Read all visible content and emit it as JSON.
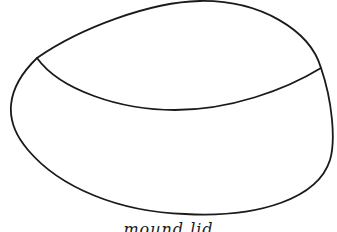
{
  "diagram": {
    "type": "line-drawing",
    "stroke_color": "#1a1a1a",
    "background": "#ffffff",
    "parts": [
      {
        "name": "outer-shape",
        "kind": "closed-oval"
      },
      {
        "name": "dividing-curve",
        "kind": "open-arc"
      }
    ],
    "caption": "mound lid"
  }
}
